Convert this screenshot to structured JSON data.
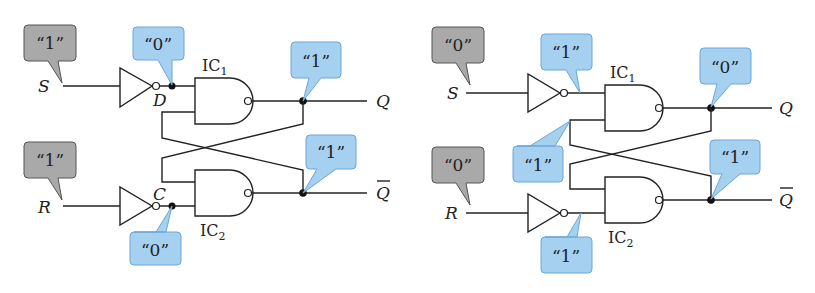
{
  "colors": {
    "input_callout": "#a9a9a9",
    "node_callout": "#a6d0f0",
    "wire": "#222222"
  },
  "circuits": [
    {
      "name": "left",
      "inputs": {
        "S": {
          "label": "S",
          "value": "“1”"
        },
        "R": {
          "label": "R",
          "value": "“1”"
        }
      },
      "nodes": {
        "D": {
          "label": "D",
          "value": "“0”"
        },
        "C": {
          "label": "C",
          "value": "“0”"
        }
      },
      "gates": {
        "ic1": {
          "label": "IC",
          "sub": "1"
        },
        "ic2": {
          "label": "IC",
          "sub": "2"
        }
      },
      "outputs": {
        "Q": {
          "label": "Q",
          "value": "“1”"
        },
        "Qbar": {
          "label": "Q",
          "value": "“1”"
        }
      }
    },
    {
      "name": "right",
      "inputs": {
        "S": {
          "label": "S",
          "value": "“0”"
        },
        "R": {
          "label": "R",
          "value": "“0”"
        }
      },
      "nodes": {
        "n1": {
          "value": "“1”"
        },
        "n2": {
          "value": "“1”"
        },
        "cross": {
          "value": "“1”"
        }
      },
      "gates": {
        "ic1": {
          "label": "IC",
          "sub": "1"
        },
        "ic2": {
          "label": "IC",
          "sub": "2"
        }
      },
      "outputs": {
        "Q": {
          "label": "Q",
          "value": "“0”"
        },
        "Qbar": {
          "label": "Q",
          "value": "“1”"
        }
      }
    }
  ]
}
